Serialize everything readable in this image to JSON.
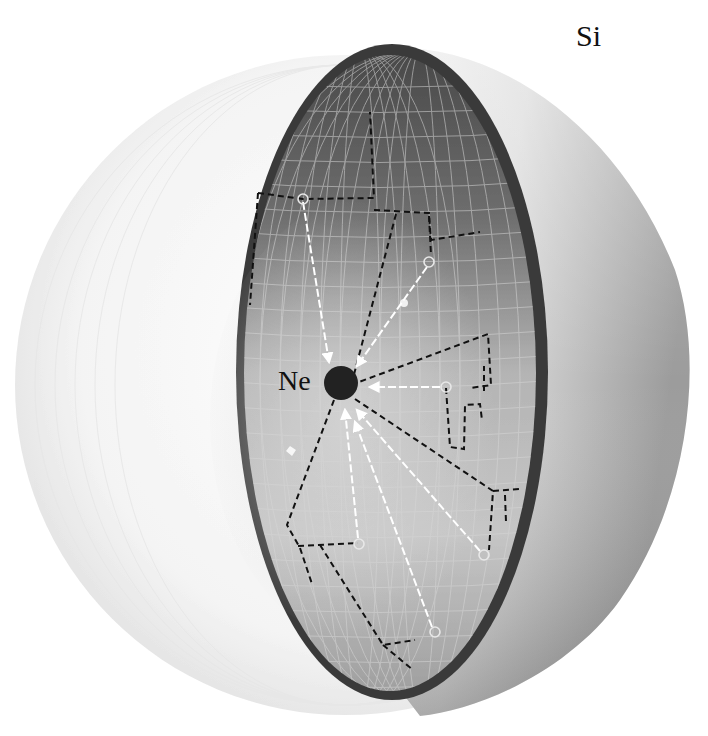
{
  "figure": {
    "labels": {
      "outer_shell": "Si",
      "center_atom": "Ne"
    },
    "colors": {
      "background": "#ffffff",
      "ghost_sphere": "#e8e8e8",
      "outer_shell_light": "#f2f2f2",
      "outer_shell_dark": "#9a9a9a",
      "shell_rim": "#3a3a3a",
      "inner_surface_top": "#555555",
      "inner_surface_mid": "#a8a8a8",
      "inner_surface_bottom": "#c8c8c8",
      "grid_lines": "#d8d8d8",
      "center_atom": "#222222",
      "arrows": "#ffffff",
      "dashed_paths": "#111111"
    },
    "center": {
      "x": 341,
      "y": 383,
      "r": 17
    },
    "impact_sites": [
      {
        "x": 303,
        "y": 199
      },
      {
        "x": 429,
        "y": 262
      },
      {
        "x": 446,
        "y": 387
      },
      {
        "x": 359,
        "y": 544
      },
      {
        "x": 484,
        "y": 555
      },
      {
        "x": 435,
        "y": 632
      }
    ]
  }
}
